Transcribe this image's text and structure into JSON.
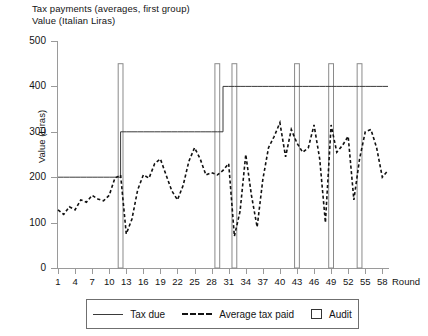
{
  "header": {
    "title": "Tax payments (averages, first group)",
    "subtitle": "Value (Italian Liras)"
  },
  "axes": {
    "ylabel": "Value (Liras)",
    "xlabel": "Round",
    "yticks": [
      "0",
      "100",
      "200",
      "300",
      "400",
      "500"
    ],
    "xticks": [
      "1",
      "4",
      "7",
      "10",
      "13",
      "16",
      "19",
      "22",
      "25",
      "28",
      "31",
      "34",
      "37",
      "40",
      "43",
      "46",
      "49",
      "52",
      "55",
      "58"
    ]
  },
  "legend": {
    "items": [
      {
        "label": "Tax due",
        "marker": "solid-line"
      },
      {
        "label": "Average tax paid",
        "marker": "dashed-line"
      },
      {
        "label": "Audit",
        "marker": "open-square"
      }
    ]
  },
  "colors": {
    "tax_due_line": "#3a3a3a",
    "tax_paid_line": "#111111",
    "audit_bar": "#8a8a8a",
    "axis": "#9a9a9a"
  },
  "chart_data": {
    "type": "line",
    "title": "Tax payments (averages, first group)",
    "subtitle": "Value (Italian Liras)",
    "xlabel": "Round",
    "ylabel": "Value (Liras)",
    "xlim": [
      1,
      59
    ],
    "ylim": [
      0,
      500
    ],
    "ytick_step": 100,
    "xtick_step": 3,
    "grid": false,
    "legend_position": "bottom",
    "x": [
      1,
      2,
      3,
      4,
      5,
      6,
      7,
      8,
      9,
      10,
      11,
      12,
      13,
      14,
      15,
      16,
      17,
      18,
      19,
      20,
      21,
      22,
      23,
      24,
      25,
      26,
      27,
      28,
      29,
      30,
      31,
      32,
      33,
      34,
      35,
      36,
      37,
      38,
      39,
      40,
      41,
      42,
      43,
      44,
      45,
      46,
      47,
      48,
      49,
      50,
      51,
      52,
      53,
      54,
      55,
      56,
      57,
      58,
      59
    ],
    "series": [
      {
        "name": "Tax due",
        "style": "solid",
        "values": [
          200,
          200,
          200,
          200,
          200,
          200,
          200,
          200,
          200,
          200,
          200,
          300,
          300,
          300,
          300,
          300,
          300,
          300,
          300,
          300,
          300,
          300,
          300,
          300,
          300,
          300,
          300,
          300,
          300,
          400,
          400,
          400,
          400,
          400,
          400,
          400,
          400,
          400,
          400,
          400,
          400,
          400,
          400,
          400,
          400,
          400,
          400,
          400,
          400,
          400,
          400,
          400,
          400,
          400,
          400,
          400,
          400,
          400,
          400
        ]
      },
      {
        "name": "Average tax paid",
        "style": "dashed",
        "values": [
          128,
          118,
          135,
          128,
          150,
          145,
          160,
          152,
          148,
          160,
          198,
          205,
          75,
          108,
          172,
          205,
          198,
          230,
          240,
          205,
          170,
          150,
          182,
          235,
          265,
          240,
          205,
          210,
          205,
          215,
          230,
          70,
          125,
          250,
          160,
          90,
          195,
          265,
          290,
          320,
          245,
          305,
          275,
          255,
          265,
          315,
          240,
          100,
          315,
          255,
          270,
          290,
          150,
          240,
          300,
          305,
          265,
          200,
          215
        ]
      }
    ],
    "audit_rounds": [
      12,
      29,
      32,
      43,
      49,
      54
    ],
    "audit_bar_top_value": 450
  }
}
